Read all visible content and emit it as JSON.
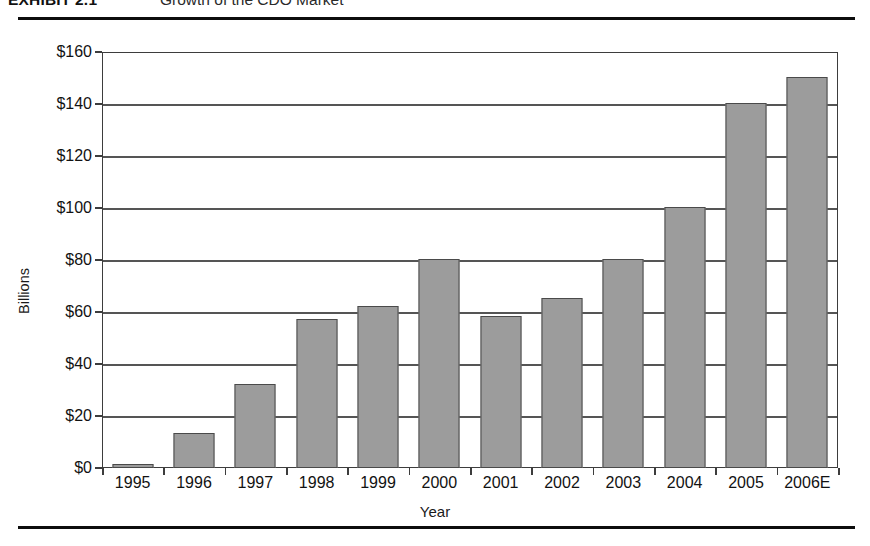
{
  "exhibit": {
    "label": "EXHIBIT 2.1",
    "title": "Growth of the CDO Market"
  },
  "chart_data": {
    "type": "bar",
    "title": "Growth of the CDO Market",
    "xlabel": "Year",
    "ylabel": "Billions",
    "ylim": [
      0,
      160
    ],
    "ytick_values": [
      0,
      20,
      40,
      60,
      80,
      100,
      120,
      140,
      160
    ],
    "ytick_labels": [
      "$0",
      "$20",
      "$40",
      "$60",
      "$80",
      "$100",
      "$120",
      "$140",
      "$160"
    ],
    "grid": true,
    "legend": "none",
    "categories": [
      "1995",
      "1996",
      "1997",
      "1998",
      "1999",
      "2000",
      "2001",
      "2002",
      "2003",
      "2004",
      "2005",
      "2006E"
    ],
    "values": [
      1.5,
      13.5,
      32.5,
      57.5,
      62.5,
      80.5,
      58.5,
      65.5,
      80.5,
      100.5,
      140.5,
      150.5
    ],
    "bar_fill_color": "#9c9c9c",
    "bar_border_color": "#4a4a4a"
  }
}
